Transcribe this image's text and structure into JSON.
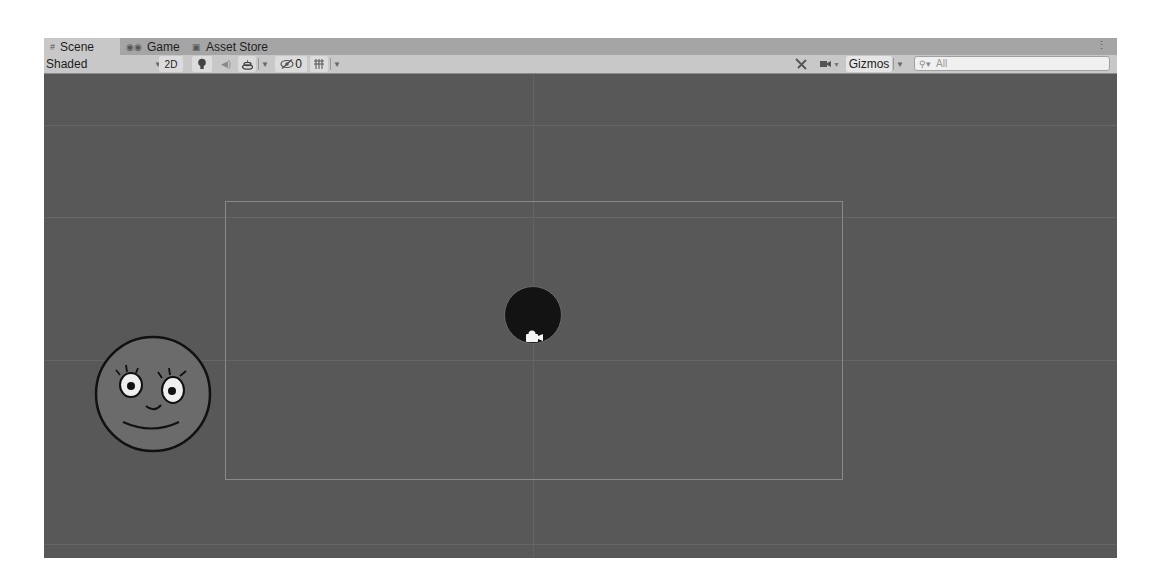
{
  "tabs": [
    {
      "label": "Scene",
      "icon": "grid-icon",
      "active": true
    },
    {
      "label": "Game",
      "icon": "gamepad-icon",
      "active": false
    },
    {
      "label": "Asset Store",
      "icon": "shopping-bag-icon",
      "active": false
    }
  ],
  "toolbar": {
    "shading_mode": "Shaded",
    "mode_2d_label": "2D",
    "lighting_icon": "lightbulb-icon",
    "audio_icon": "speaker-icon",
    "effects_icon": "effects-layers-icon",
    "hidden_count": "0",
    "grid_icon": "grid-snap-icon",
    "tools_icon": "tools-icon",
    "camera_icon": "camera-icon",
    "gizmos_label": "Gizmos",
    "search_placeholder": "All",
    "search_icon": "search-icon"
  },
  "scene": {
    "objects": [
      {
        "name": "Ball",
        "shape": "circle",
        "color": "#131313"
      },
      {
        "name": "Face",
        "shape": "circle",
        "color": "#6c6c6c"
      },
      {
        "name": "Main Camera",
        "icon": "camera-gizmo-icon"
      }
    ]
  },
  "colors": {
    "scene_bg": "#585858",
    "toolbar_bg": "#c8c8c8",
    "tabbar_bg": "#a5a5a5"
  }
}
